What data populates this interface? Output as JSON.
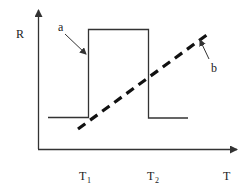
{
  "diagram": {
    "y_axis_label": "R",
    "x_axis_label": "T",
    "tick_labels": [
      {
        "main": "T",
        "sub": "1"
      },
      {
        "main": "T",
        "sub": "2"
      }
    ],
    "curve_a": {
      "label": "a",
      "style": "solid",
      "shape": "rectangular-pulse",
      "description": "step: low before T1, high between T1 and T2, low after T2"
    },
    "curve_b": {
      "label": "b",
      "style": "dashed",
      "shape": "linear-ramp",
      "description": "increasing straight line from near T1 rising past T2"
    },
    "colors": {
      "line": "#333333",
      "text": "#222222",
      "background": "#ffffff"
    }
  }
}
